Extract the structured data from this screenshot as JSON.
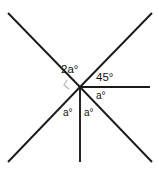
{
  "figure": {
    "name": "intersecting-rays-angle-diagram",
    "width": 159,
    "height": 170,
    "background_color": "#ffffff",
    "line_color": "#1a1a1a",
    "angle_mark_color": "#b9b9b9",
    "vertex": {
      "x": 80,
      "y": 87
    }
  },
  "rays": [
    {
      "id": "ray-upper-left",
      "label": "upper-left-diagonal",
      "x1": 80,
      "y1": 87,
      "x2": 8,
      "y2": 13
    },
    {
      "id": "ray-lower-right",
      "label": "lower-right-diagonal",
      "x1": 80,
      "y1": 87,
      "x2": 152,
      "y2": 162
    },
    {
      "id": "ray-upper-right",
      "label": "upper-right-diagonal",
      "x1": 80,
      "y1": 87,
      "x2": 152,
      "y2": 13
    },
    {
      "id": "ray-lower-left",
      "label": "lower-left-diagonal",
      "x1": 80,
      "y1": 87,
      "x2": 8,
      "y2": 162
    },
    {
      "id": "ray-right-horizontal",
      "label": "horizontal-right-ray",
      "x1": 80,
      "y1": 87,
      "x2": 150,
      "y2": 87
    },
    {
      "id": "ray-down-vertical",
      "label": "vertical-down-ray",
      "x1": 80,
      "y1": 87,
      "x2": 80,
      "y2": 162
    }
  ],
  "angle_mark": {
    "name": "left-angle-mark",
    "points": "67,80 64,85 69,89"
  },
  "labels": {
    "top_left_angle": "2a°",
    "upper_right_angle": "45°",
    "right_lower_angle": "a°",
    "bottom_left_angle": "a°",
    "bottom_right_angle": "a°"
  }
}
